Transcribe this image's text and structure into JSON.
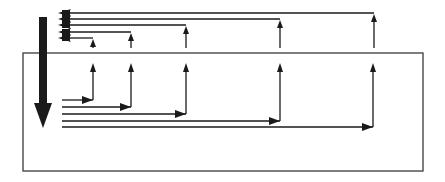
{
  "diagram": {
    "colors": {
      "stroke": "#1a1a1a",
      "background": "#ffffff",
      "box": "#3a3a3a"
    },
    "box": {
      "x": 23,
      "y": 53,
      "width": 400,
      "height": 118
    },
    "main_arrow": {
      "x": 43,
      "y_start": 17,
      "y_end": 128,
      "direction": "down"
    },
    "upper_branches": [
      {
        "y": 13,
        "x_end": 374,
        "arrow_y_from": 48
      },
      {
        "y": 19,
        "x_end": 280,
        "arrow_y_from": 48
      },
      {
        "y": 25,
        "x_end": 186,
        "arrow_y_from": 48
      },
      {
        "y": 32,
        "x_end": 131,
        "arrow_y_from": 48
      },
      {
        "y": 38,
        "x_end": 93,
        "arrow_y_from": 48
      }
    ],
    "lower_branches": [
      {
        "y": 100,
        "x_start": 62,
        "x_end": 93,
        "arrow_y_to": 63
      },
      {
        "y": 107,
        "x_start": 62,
        "x_end": 131,
        "arrow_y_to": 63
      },
      {
        "y": 114,
        "x_start": 62,
        "x_end": 186,
        "arrow_y_to": 63
      },
      {
        "y": 121,
        "x_start": 62,
        "x_end": 280,
        "arrow_y_to": 63
      },
      {
        "y": 127,
        "x_start": 62,
        "x_end": 373,
        "arrow_y_to": 63
      }
    ]
  }
}
